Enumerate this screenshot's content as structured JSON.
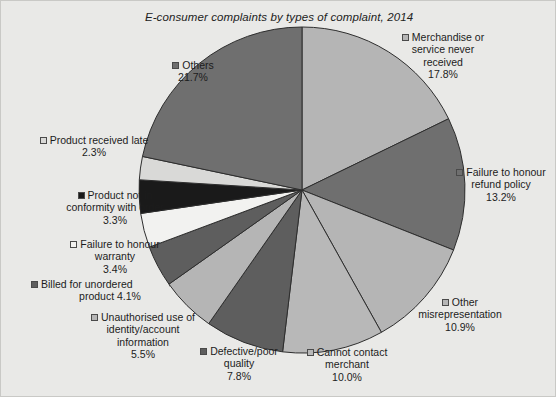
{
  "chart_data": {
    "type": "pie",
    "title": "E-consumer complaints by types of complaint, 2014",
    "xlabel": "",
    "ylabel": "",
    "legend_position": "labels-around-pie",
    "grid": false,
    "unit": "%",
    "categories": [
      "Merchandise or service never received",
      "Failure to honour refund policy",
      "Other misrepresentation",
      "Cannot contact merchant",
      "Defective/poor quality",
      "Unauthorised use of identity/account information",
      "Billed for unordered product",
      "Failure to honour warranty",
      "Product not in conformity with order",
      "Product received late",
      "Others"
    ],
    "values": [
      17.8,
      13.2,
      10.9,
      10.0,
      7.8,
      5.5,
      4.1,
      3.4,
      3.3,
      2.3,
      21.7
    ],
    "colors": [
      "#b5b5b5",
      "#6f6f6f",
      "#b5b5b5",
      "#b8b8b8",
      "#5e5e5e",
      "#b5b5b5",
      "#5e5e5e",
      "#f2f2f0",
      "#1a1a1a",
      "#d9d9d7",
      "#6f6f6f"
    ]
  },
  "figure": {
    "title": "E-consumer complaints by types of complaint, 2014",
    "background": "#e9e9e7",
    "border_color": "#c9c9c6"
  },
  "labels": [
    {
      "name": "merchandise-never-received",
      "line1": "Merchandise or",
      "line2": "service never",
      "line3": "received",
      "pct": "17.8%",
      "swatch": "#b5b5b5"
    },
    {
      "name": "failure-honour-refund-policy",
      "line1": "Failure to honour",
      "line2": "refund policy",
      "line3": "",
      "pct": "13.2%",
      "swatch": "#6f6f6f"
    },
    {
      "name": "other-misrepresentation",
      "line1": "Other",
      "line2": "misrepresentation",
      "line3": "",
      "pct": "10.9%",
      "swatch": "#b5b5b5"
    },
    {
      "name": "cannot-contact-merchant",
      "line1": "Cannot contact",
      "line2": "merchant",
      "line3": "",
      "pct": "10.0%",
      "swatch": "#b8b8b8"
    },
    {
      "name": "defective-poor-quality",
      "line1": "Defective/poor",
      "line2": "quality",
      "line3": "",
      "pct": "7.8%",
      "swatch": "#5e5e5e"
    },
    {
      "name": "unauthorised-use-identity",
      "line1": "Unauthorised use of",
      "line2": "identity/account",
      "line3": "information",
      "pct": "5.5%",
      "swatch": "#b5b5b5"
    },
    {
      "name": "billed-unordered-product",
      "line1": "Billed for unordered",
      "line2": "product 4.1%",
      "line3": "",
      "pct": "",
      "swatch": "#5e5e5e"
    },
    {
      "name": "failure-honour-warranty",
      "line1": "Failure to honour",
      "line2": "warranty",
      "line3": "",
      "pct": "3.4%",
      "swatch": "#f2f2f0"
    },
    {
      "name": "product-not-in-conformity",
      "line1": "Product not in",
      "line2": "conformity with order",
      "line3": "",
      "pct": "3.3%",
      "swatch": "#1a1a1a"
    },
    {
      "name": "product-received-late",
      "line1": "Product received late",
      "line2": "",
      "line3": "",
      "pct": "2.3%",
      "swatch": "#d9d9d7"
    },
    {
      "name": "others",
      "line1": "Others",
      "line2": "",
      "line3": "",
      "pct": "21.7%",
      "swatch": "#6f6f6f"
    }
  ]
}
